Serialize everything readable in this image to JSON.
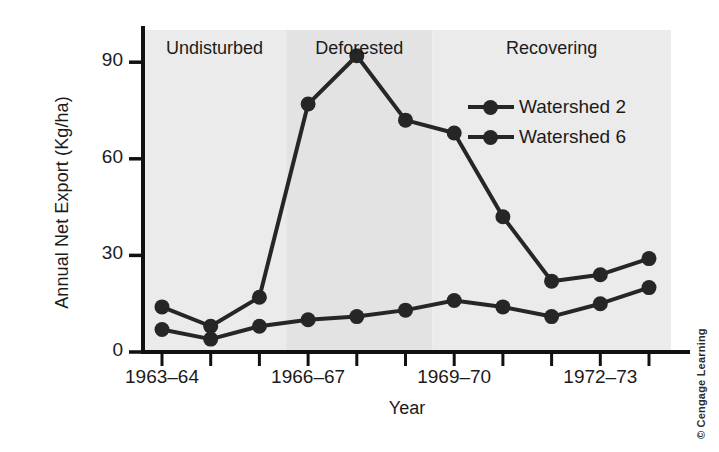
{
  "figure": {
    "credit": "© Cengage Learning"
  },
  "chart_data": {
    "type": "line",
    "title": "",
    "xlabel": "Year",
    "ylabel": "Annual Net Export (Kg/ha)",
    "ylim": [
      0,
      100
    ],
    "yticks": [
      0,
      30,
      60,
      90
    ],
    "ytick_labels": [
      "0",
      "30",
      "60",
      "90"
    ],
    "grid": false,
    "legend_position": "upper right",
    "x": [
      1,
      2,
      3,
      4,
      5,
      6,
      7,
      8,
      9,
      10,
      11
    ],
    "xtick_positions": [
      1,
      2,
      3,
      4,
      5,
      6,
      7,
      8,
      9,
      10,
      11
    ],
    "xtick_labels": [
      "1963–64",
      "",
      "",
      "1966–67",
      "",
      "",
      "1969–70",
      "",
      "",
      "1972–73",
      ""
    ],
    "labeled_xticks": [
      {
        "pos": 1,
        "label": "1963–64"
      },
      {
        "pos": 4,
        "label": "1966–67"
      },
      {
        "pos": 7,
        "label": "1969–70"
      },
      {
        "pos": 10,
        "label": "1972–73"
      }
    ],
    "series": [
      {
        "name": "Watershed 2",
        "color": "#262626",
        "values": [
          14,
          8,
          17,
          77,
          92,
          72,
          68,
          42,
          22,
          24,
          29
        ]
      },
      {
        "name": "Watershed 6",
        "color": "#262626",
        "values": [
          7,
          4,
          8,
          10,
          11,
          13,
          16,
          14,
          11,
          15,
          20
        ]
      }
    ],
    "bands": [
      {
        "label": "Undisturbed",
        "x_start": 0.5,
        "x_end": 3.55,
        "color": "#ebebeb"
      },
      {
        "label": "Deforested",
        "x_start": 3.55,
        "x_end": 6.55,
        "color": "#e3e3e3"
      },
      {
        "label": "Recovering",
        "x_start": 6.55,
        "x_end": 11.55,
        "color": "#ebebeb"
      }
    ]
  }
}
